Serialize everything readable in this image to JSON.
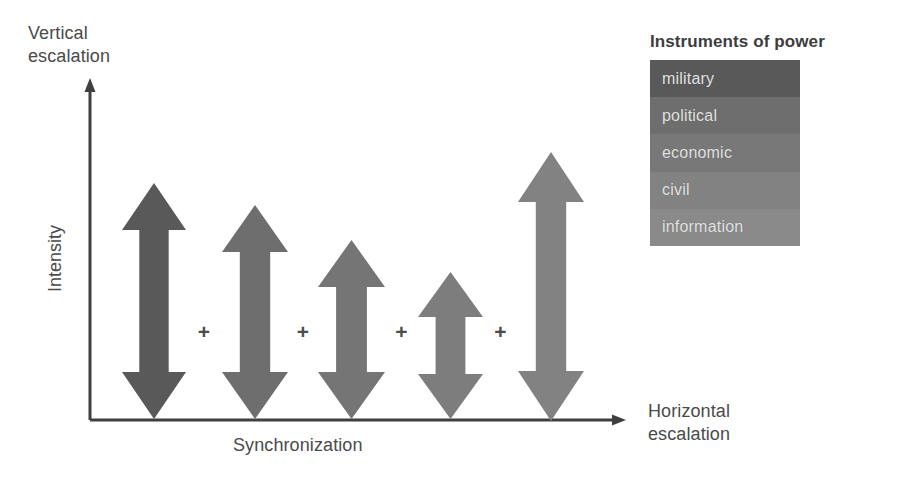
{
  "diagram": {
    "axes": {
      "y_axis_caption": "Vertical\nescalation",
      "y_axis_title": "Intensity",
      "x_axis_caption": "Horizontal\nescalation",
      "x_axis_title": "Synchronization",
      "axis_color": "#3f3f3f"
    },
    "operators": [
      "+",
      "+",
      "+",
      "+"
    ],
    "arrows": [
      {
        "name": "military",
        "color": "#595959",
        "x": 122,
        "width": 64,
        "top": 183,
        "bottom": 419,
        "head": 47,
        "shaft_ratio": 0.46
      },
      {
        "name": "political",
        "color": "#6e6e6e",
        "x": 222,
        "width": 66,
        "top": 205,
        "bottom": 419,
        "head": 47,
        "shaft_ratio": 0.46
      },
      {
        "name": "economic",
        "color": "#757575",
        "x": 318,
        "width": 67,
        "top": 240,
        "bottom": 419,
        "head": 47,
        "shaft_ratio": 0.46
      },
      {
        "name": "civil",
        "color": "#7d7d7d",
        "x": 418,
        "width": 65,
        "top": 272,
        "bottom": 419,
        "head": 45,
        "shaft_ratio": 0.46
      },
      {
        "name": "information",
        "color": "#828282",
        "x": 518,
        "width": 66,
        "top": 152,
        "bottom": 421,
        "head": 50,
        "shaft_ratio": 0.46
      }
    ]
  },
  "legend": {
    "title": "Instruments of power",
    "items": [
      {
        "label": "military",
        "color": "#595959"
      },
      {
        "label": "political",
        "color": "#6e6e6e"
      },
      {
        "label": "economic",
        "color": "#787878"
      },
      {
        "label": "civil",
        "color": "#828282"
      },
      {
        "label": "information",
        "color": "#8a8a8a"
      }
    ]
  },
  "chart_data": {
    "type": "diagram",
    "xlabel": "Synchronization",
    "ylabel": "Intensity",
    "x_axis_end_label": "Horizontal escalation",
    "y_axis_end_label": "Vertical escalation",
    "categories": [
      "military",
      "political",
      "economic",
      "civil",
      "information"
    ],
    "values": [
      236,
      214,
      179,
      147,
      269
    ],
    "value_units": "arrow length in pixels (relative intensity range)"
  }
}
